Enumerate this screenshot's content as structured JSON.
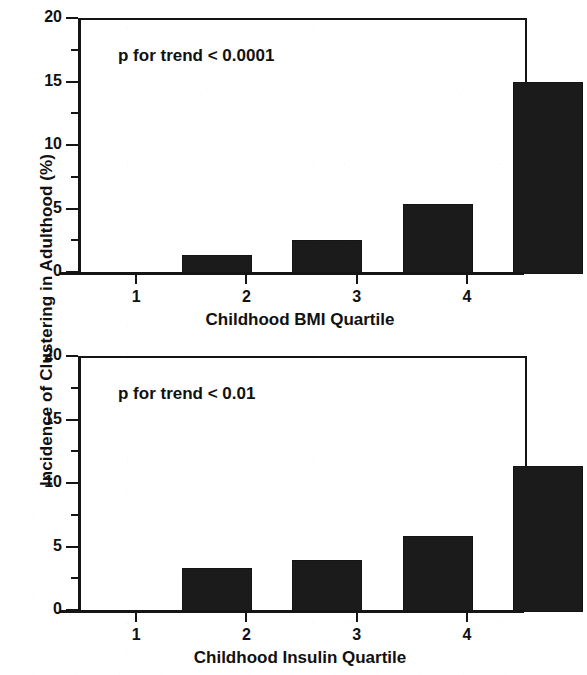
{
  "figure": {
    "shared_y_axis_title": "Incidence of Clustering in Adulthood (%)"
  },
  "chart_data": [
    {
      "type": "bar",
      "title": "",
      "xlabel": "Childhood BMI Quartile",
      "ylabel": "Incidence of Clustering in Adulthood (%)",
      "categories": [
        "1",
        "2",
        "3",
        "4"
      ],
      "values": [
        1.5,
        2.7,
        5.5,
        15.1
      ],
      "ylim": [
        0,
        20
      ],
      "yticks": [
        "0",
        "5",
        "10",
        "15",
        "20"
      ],
      "ytick_values": [
        0,
        5,
        10,
        15,
        20
      ],
      "minor_ticks": [
        2.5,
        7.5,
        12.5,
        17.5
      ],
      "grid": false,
      "legend": "none",
      "bar_color": "#1b1b1b",
      "annotation": "p for trend < 0.0001"
    },
    {
      "type": "bar",
      "title": "",
      "xlabel": "Childhood Insulin Quartile",
      "ylabel": "Incidence of Clustering in Adulthood (%)",
      "categories": [
        "1",
        "2",
        "3",
        "4"
      ],
      "values": [
        3.5,
        4.1,
        6.0,
        11.5
      ],
      "ylim": [
        0,
        20
      ],
      "yticks": [
        "0",
        "5",
        "10",
        "15",
        "20"
      ],
      "ytick_values": [
        0,
        5,
        10,
        15,
        20
      ],
      "minor_ticks": [
        2.5,
        7.5,
        12.5,
        17.5
      ],
      "grid": false,
      "legend": "none",
      "bar_color": "#1b1b1b",
      "annotation": "p for trend < 0.01"
    }
  ]
}
